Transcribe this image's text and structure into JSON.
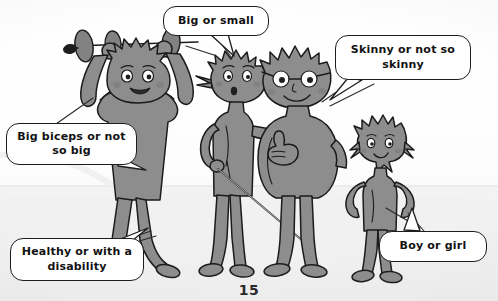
{
  "page": {
    "number": "15",
    "alt": "Five grey cartoon figures illustrating body diversity, each with a speech bubble",
    "background_color": "#fdfdfd",
    "ink_color": "#1d1d1d",
    "figure_fill": "#8d8d8d",
    "figure_shadow": "#757575",
    "bubble_fill": "#ffffff",
    "text_color": "#121212",
    "floor_color": "#f0f0f0"
  },
  "bubbles": [
    {
      "id": "biceps",
      "text": "Big biceps or not so big",
      "points_to": "weightlifter-figure"
    },
    {
      "id": "big",
      "text": "Big or small",
      "points_to": "spiky-thin-figure"
    },
    {
      "id": "skinny",
      "text": "Skinny or not so skinny",
      "points_to": "glasses-figure"
    },
    {
      "id": "health",
      "text": "Healthy or with a disability",
      "points_to": "cane-figure"
    },
    {
      "id": "boy",
      "text": "Boy or girl",
      "points_to": "long-hair-figure"
    }
  ],
  "figures": [
    {
      "id": "weightlifter",
      "name": "weightlifter-figure",
      "description": "Tall figure with spiky hair lifting a barbell overhead, flexed biceps, smiling"
    },
    {
      "id": "thin",
      "name": "spiky-thin-figure",
      "description": "Thin figure with spiky hair, hand on hip, holding a white cane"
    },
    {
      "id": "glasses",
      "name": "glasses-figure",
      "description": "Larger round figure with spiky hair and round glasses giving a thumbs up"
    },
    {
      "id": "small",
      "name": "long-hair-figure",
      "description": "Small figure with long hair and hands on hips"
    }
  ]
}
